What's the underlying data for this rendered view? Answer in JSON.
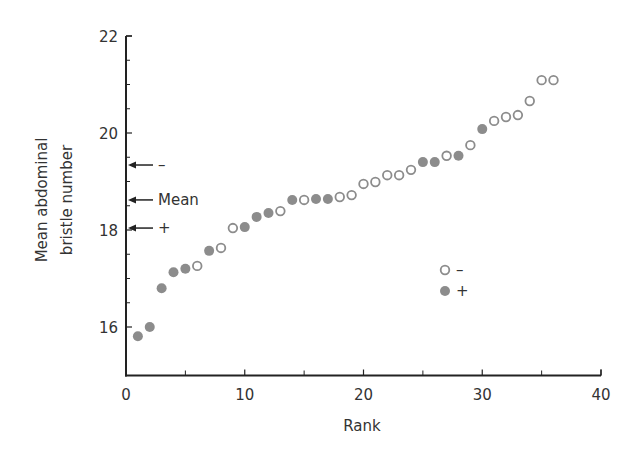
{
  "chart_data": {
    "type": "scatter",
    "title": "",
    "xlabel": "Rank",
    "ylabel": [
      "Mean abdominal",
      "bristle number"
    ],
    "xlim": [
      0,
      40
    ],
    "ylim": [
      15,
      22
    ],
    "x_ticks_major": [
      0,
      10,
      20,
      30,
      40
    ],
    "x_ticks_minor": [
      5,
      15,
      25,
      35
    ],
    "y_ticks_major": [
      16,
      18,
      20,
      22
    ],
    "y_ticks_minor": [
      16.5,
      17,
      17.5,
      18.5,
      19,
      19.5,
      20.5,
      21,
      21.5
    ],
    "y_tick_labels_shown": [
      16,
      18,
      20,
      22
    ],
    "grid": false,
    "legend": {
      "position": "right-middle",
      "entries": [
        {
          "label": "–",
          "marker": "open",
          "series": "minus"
        },
        {
          "label": "+",
          "marker": "filled",
          "series": "plus"
        }
      ]
    },
    "annotations": [
      {
        "label": "–",
        "y": 19.34,
        "type": "arrow-left"
      },
      {
        "label": "Mean",
        "y": 18.62,
        "type": "arrow-left"
      },
      {
        "label": "+",
        "y": 18.04,
        "type": "arrow-left"
      }
    ],
    "series": [
      {
        "name": "–",
        "marker": "open",
        "x": [
          6,
          8,
          9,
          13,
          15,
          18,
          19,
          20,
          21,
          22,
          23,
          24,
          27,
          29,
          31,
          32,
          33,
          34,
          35,
          36
        ],
        "y": [
          17.26,
          17.63,
          18.04,
          18.39,
          18.62,
          18.68,
          18.72,
          18.95,
          18.99,
          19.13,
          19.13,
          19.24,
          19.53,
          19.75,
          20.25,
          20.33,
          20.37,
          20.66,
          21.09,
          21.09
        ]
      },
      {
        "name": "+",
        "marker": "filled",
        "x": [
          1,
          2,
          3,
          4,
          5,
          7,
          10,
          11,
          12,
          14,
          16,
          17,
          25,
          26,
          28,
          30
        ],
        "y": [
          15.81,
          16.0,
          16.8,
          17.13,
          17.2,
          17.57,
          18.06,
          18.27,
          18.35,
          18.62,
          18.64,
          18.64,
          19.4,
          19.4,
          19.53,
          20.08
        ]
      }
    ],
    "colors": {
      "marker": "#8c8c8c",
      "axis": "#222222",
      "text": "#333333"
    }
  }
}
